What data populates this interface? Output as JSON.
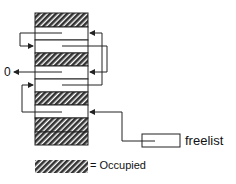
{
  "diagram": {
    "null_label": "0",
    "freelist_label": "freelist",
    "legend_label": "= Occupied",
    "blocks": [
      "occupied",
      "free",
      "free",
      "occupied",
      "free",
      "free",
      "occupied",
      "occupied"
    ],
    "colors": {
      "line": "#222222",
      "hatch": "#333333",
      "background": "#ffffff"
    }
  }
}
